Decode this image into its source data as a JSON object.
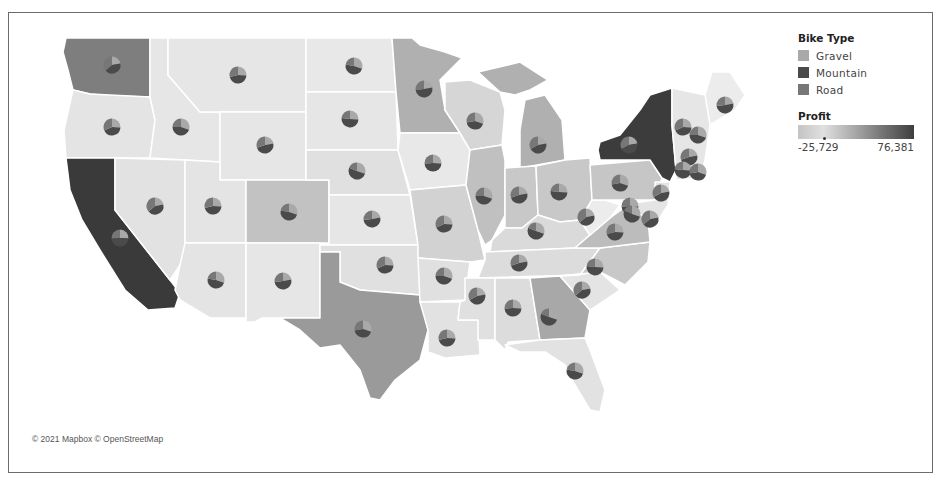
{
  "legend": {
    "bike_type": {
      "title": "Bike Type",
      "items": [
        {
          "label": "Gravel",
          "color": "#a9a9a9"
        },
        {
          "label": "Mountain",
          "color": "#4a4a4a"
        },
        {
          "label": "Road",
          "color": "#777777"
        }
      ]
    },
    "profit": {
      "title": "Profit",
      "min_label": "-25,729",
      "max_label": "76,381"
    }
  },
  "attribution": "© 2021 Mapbox © OpenStreetMap",
  "colors": {
    "state_default": "#e6e6e6",
    "state_light": "#d4d4d4",
    "state_mid": "#b5b5b5",
    "state_midplus": "#9e9e9e",
    "state_dark": "#3a3a3a",
    "state_border": "#ffffff"
  },
  "states": [
    {
      "name": "Washington",
      "shade": "#7e7e7e"
    },
    {
      "name": "Oregon",
      "shade": "#e4e4e4"
    },
    {
      "name": "California",
      "shade": "#3a3a3a"
    },
    {
      "name": "Idaho",
      "shade": "#e6e6e6"
    },
    {
      "name": "Nevada",
      "shade": "#e2e2e2"
    },
    {
      "name": "Montana",
      "shade": "#e6e6e6"
    },
    {
      "name": "Wyoming",
      "shade": "#e6e6e6"
    },
    {
      "name": "Utah",
      "shade": "#e4e4e4"
    },
    {
      "name": "Arizona",
      "shade": "#e4e4e4"
    },
    {
      "name": "Colorado",
      "shade": "#c2c2c2"
    },
    {
      "name": "New Mexico",
      "shade": "#e6e6e6"
    },
    {
      "name": "North Dakota",
      "shade": "#e8e8e8"
    },
    {
      "name": "South Dakota",
      "shade": "#e6e6e6"
    },
    {
      "name": "Nebraska",
      "shade": "#e0e0e0"
    },
    {
      "name": "Kansas",
      "shade": "#e6e6e6"
    },
    {
      "name": "Oklahoma",
      "shade": "#e0e0e0"
    },
    {
      "name": "Texas",
      "shade": "#9a9a9a"
    },
    {
      "name": "Minnesota",
      "shade": "#b0b0b0"
    },
    {
      "name": "Iowa",
      "shade": "#e8e8e8"
    },
    {
      "name": "Missouri",
      "shade": "#d2d2d2"
    },
    {
      "name": "Arkansas",
      "shade": "#e0e0e0"
    },
    {
      "name": "Louisiana",
      "shade": "#e2e2e2"
    },
    {
      "name": "Wisconsin",
      "shade": "#d6d6d6"
    },
    {
      "name": "Illinois",
      "shade": "#c0c0c0"
    },
    {
      "name": "Michigan",
      "shade": "#b0b0b0"
    },
    {
      "name": "Indiana",
      "shade": "#c8c8c8"
    },
    {
      "name": "Ohio",
      "shade": "#c8c8c8"
    },
    {
      "name": "Kentucky",
      "shade": "#dadada"
    },
    {
      "name": "Tennessee",
      "shade": "#dcdcdc"
    },
    {
      "name": "Mississippi",
      "shade": "#e0e0e0"
    },
    {
      "name": "Alabama",
      "shade": "#dcdcdc"
    },
    {
      "name": "Georgia",
      "shade": "#a8a8a8"
    },
    {
      "name": "Florida",
      "shade": "#e2e2e2"
    },
    {
      "name": "South Carolina",
      "shade": "#e4e4e4"
    },
    {
      "name": "North Carolina",
      "shade": "#c8c8c8"
    },
    {
      "name": "Virginia",
      "shade": "#bcbcbc"
    },
    {
      "name": "West Virginia",
      "shade": "#ececec"
    },
    {
      "name": "Pennsylvania",
      "shade": "#c6c6c6"
    },
    {
      "name": "New York",
      "shade": "#3c3c3c"
    },
    {
      "name": "Maine",
      "shade": "#ececec"
    },
    {
      "name": "New England",
      "shade": "#e6e6e6"
    },
    {
      "name": "Mid-Atlantic",
      "shade": "#e4e4e4"
    }
  ],
  "pies": [
    {
      "state": "WA",
      "x": 112,
      "y": 65
    },
    {
      "state": "MT",
      "x": 238,
      "y": 75
    },
    {
      "state": "ND",
      "x": 354,
      "y": 66
    },
    {
      "state": "MN",
      "x": 424,
      "y": 89
    },
    {
      "state": "OR",
      "x": 112,
      "y": 127
    },
    {
      "state": "ID",
      "x": 181,
      "y": 127
    },
    {
      "state": "WY",
      "x": 265,
      "y": 145
    },
    {
      "state": "SD",
      "x": 350,
      "y": 119
    },
    {
      "state": "WI",
      "x": 475,
      "y": 121
    },
    {
      "state": "MI",
      "x": 538,
      "y": 145
    },
    {
      "state": "IA",
      "x": 433,
      "y": 163
    },
    {
      "state": "NE",
      "x": 357,
      "y": 171
    },
    {
      "state": "NV",
      "x": 155,
      "y": 206
    },
    {
      "state": "UT",
      "x": 213,
      "y": 206
    },
    {
      "state": "CO",
      "x": 289,
      "y": 212
    },
    {
      "state": "KS",
      "x": 372,
      "y": 219
    },
    {
      "state": "MO",
      "x": 444,
      "y": 224
    },
    {
      "state": "IL",
      "x": 484,
      "y": 196
    },
    {
      "state": "IN",
      "x": 519,
      "y": 195
    },
    {
      "state": "OH",
      "x": 559,
      "y": 192
    },
    {
      "state": "PA",
      "x": 620,
      "y": 183
    },
    {
      "state": "NY",
      "x": 629,
      "y": 145
    },
    {
      "state": "CA",
      "x": 120,
      "y": 238
    },
    {
      "state": "KY",
      "x": 536,
      "y": 231
    },
    {
      "state": "WV",
      "x": 586,
      "y": 217
    },
    {
      "state": "VA",
      "x": 615,
      "y": 232
    },
    {
      "state": "AZ",
      "x": 216,
      "y": 280
    },
    {
      "state": "NM",
      "x": 283,
      "y": 281
    },
    {
      "state": "OK",
      "x": 385,
      "y": 265
    },
    {
      "state": "AR",
      "x": 444,
      "y": 276
    },
    {
      "state": "TN",
      "x": 519,
      "y": 263
    },
    {
      "state": "NC",
      "x": 595,
      "y": 267
    },
    {
      "state": "TX",
      "x": 363,
      "y": 329
    },
    {
      "state": "MS",
      "x": 477,
      "y": 296
    },
    {
      "state": "AL",
      "x": 513,
      "y": 308
    },
    {
      "state": "GA",
      "x": 549,
      "y": 317
    },
    {
      "state": "SC",
      "x": 582,
      "y": 290
    },
    {
      "state": "LA",
      "x": 447,
      "y": 338
    },
    {
      "state": "FL",
      "x": 575,
      "y": 371
    },
    {
      "state": "ME",
      "x": 725,
      "y": 105
    },
    {
      "state": "VT",
      "x": 683,
      "y": 127
    },
    {
      "state": "NH",
      "x": 698,
      "y": 135
    },
    {
      "state": "MA",
      "x": 689,
      "y": 157
    },
    {
      "state": "CT",
      "x": 683,
      "y": 170
    },
    {
      "state": "RI",
      "x": 698,
      "y": 172
    },
    {
      "state": "NJ",
      "x": 661,
      "y": 193
    },
    {
      "state": "DE",
      "x": 630,
      "y": 206
    },
    {
      "state": "MD",
      "x": 632,
      "y": 214
    },
    {
      "state": "DC",
      "x": 650,
      "y": 219
    }
  ]
}
